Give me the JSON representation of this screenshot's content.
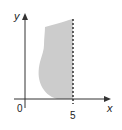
{
  "diagram": {
    "type": "coordinate-region",
    "axes": {
      "x_label": "x",
      "y_label": "y",
      "origin_label": "0"
    },
    "boundary": {
      "style": "dashed",
      "equation_label": "5",
      "x_value": 5
    },
    "region": {
      "description": "shaded irregular region to the left of the dashed line x = 5, above the x-axis",
      "fill_color": "#cccccc"
    },
    "colors": {
      "axis": "#333333",
      "boundary": "#222222",
      "region": "#cccccc"
    }
  }
}
